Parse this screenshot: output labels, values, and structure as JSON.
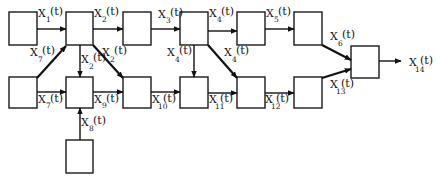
{
  "diagram": {
    "type": "block-flow-network",
    "nodes": [
      {
        "id": "B1",
        "x": 9,
        "y": 12,
        "w": 28,
        "h": 33
      },
      {
        "id": "B2",
        "x": 66,
        "y": 12,
        "w": 27,
        "h": 33
      },
      {
        "id": "B3",
        "x": 123,
        "y": 12,
        "w": 28,
        "h": 33
      },
      {
        "id": "B4",
        "x": 180,
        "y": 12,
        "w": 28,
        "h": 33
      },
      {
        "id": "B5",
        "x": 237,
        "y": 12,
        "w": 28,
        "h": 33
      },
      {
        "id": "B6",
        "x": 294,
        "y": 12,
        "w": 28,
        "h": 33
      },
      {
        "id": "B7",
        "x": 9,
        "y": 77,
        "w": 28,
        "h": 31
      },
      {
        "id": "B8",
        "x": 66,
        "y": 77,
        "w": 27,
        "h": 31
      },
      {
        "id": "B9",
        "x": 123,
        "y": 77,
        "w": 28,
        "h": 31
      },
      {
        "id": "B10",
        "x": 180,
        "y": 77,
        "w": 28,
        "h": 31
      },
      {
        "id": "B11",
        "x": 237,
        "y": 77,
        "w": 28,
        "h": 31
      },
      {
        "id": "B12",
        "x": 294,
        "y": 77,
        "w": 28,
        "h": 31
      },
      {
        "id": "B13",
        "x": 66,
        "y": 140,
        "w": 27,
        "h": 33
      },
      {
        "id": "B14",
        "x": 351,
        "y": 46,
        "w": 28,
        "h": 32
      }
    ],
    "edges": [
      {
        "from": "B1",
        "to": "B2",
        "label": "X",
        "sub": "1",
        "suffix": "(t)"
      },
      {
        "from": "B2",
        "to": "B3",
        "label": "X",
        "sub": "2",
        "suffix": "(t)"
      },
      {
        "from": "B2",
        "to": "B8",
        "label": "X",
        "sub": "2",
        "suffix": "(t)"
      },
      {
        "from": "B2",
        "to": "B9",
        "label": "X",
        "sub": "2",
        "suffix": "(t)"
      },
      {
        "from": "B3",
        "to": "B4",
        "label": "X",
        "sub": "3",
        "suffix": "(t)"
      },
      {
        "from": "B4",
        "to": "B5",
        "label": "X",
        "sub": "4",
        "suffix": "(t)"
      },
      {
        "from": "B4",
        "to": "B10",
        "label": "X",
        "sub": "4",
        "suffix": "(t)"
      },
      {
        "from": "B4",
        "to": "B11",
        "label": "X",
        "sub": "4",
        "suffix": "(t)"
      },
      {
        "from": "B5",
        "to": "B6",
        "label": "X",
        "sub": "5",
        "suffix": "(t)"
      },
      {
        "from": "B6",
        "to": "B14",
        "label": "X",
        "sub": "6",
        "suffix": "(t)"
      },
      {
        "from": "B7",
        "to": "B2",
        "label": "X",
        "sub": "7",
        "suffix": "(t)"
      },
      {
        "from": "B7",
        "to": "B8",
        "label": "X",
        "sub": "7",
        "suffix": "(t)"
      },
      {
        "from": "B13",
        "to": "B8",
        "label": "X",
        "sub": "8",
        "suffix": "(t)"
      },
      {
        "from": "B8",
        "to": "B9",
        "label": "X",
        "sub": "9",
        "suffix": "(t)"
      },
      {
        "from": "B9",
        "to": "B10",
        "label": "X",
        "sub": "10",
        "suffix": "(t)"
      },
      {
        "from": "B10",
        "to": "B11",
        "label": "X",
        "sub": "11",
        "suffix": "(t)"
      },
      {
        "from": "B11",
        "to": "B12",
        "label": "X",
        "sub": "12",
        "suffix": "(t)"
      },
      {
        "from": "B12",
        "to": "B14",
        "label": "X",
        "sub": "13",
        "suffix": "(t)"
      },
      {
        "from": "B14",
        "to": "output",
        "label": "X",
        "sub": "14",
        "suffix": "(t)"
      }
    ],
    "labels": {
      "x1": {
        "main": "X",
        "sub": "1",
        "arg": "(t)"
      },
      "x2_top": {
        "main": "X",
        "sub": "2",
        "arg": "(t)"
      },
      "x2_down": {
        "main": "X",
        "sub": "2",
        "arg": "(t)"
      },
      "x2_diag": {
        "main": "X",
        "sub": "2",
        "arg": "(t)"
      },
      "x3": {
        "main": "X",
        "sub": "3",
        "arg": "(t)"
      },
      "x4_top": {
        "main": "X",
        "sub": "4",
        "arg": "(t)"
      },
      "x4_down": {
        "main": "X",
        "sub": "4",
        "arg": "(t)"
      },
      "x4_diag": {
        "main": "X",
        "sub": "4",
        "arg": "(t)"
      },
      "x5": {
        "main": "X",
        "sub": "5",
        "arg": "(t)"
      },
      "x6": {
        "main": "X",
        "sub": "6",
        "arg": "(t)"
      },
      "x7_diag": {
        "main": "X",
        "sub": "7",
        "arg": "(t)"
      },
      "x7_bottom": {
        "main": "X",
        "sub": "7",
        "arg": "(t)"
      },
      "x8": {
        "main": "X",
        "sub": "8",
        "arg": "(t)"
      },
      "x9": {
        "main": "X",
        "sub": "9",
        "arg": "(t)"
      },
      "x10": {
        "main": "X",
        "sub": "10",
        "arg": "(t)"
      },
      "x11": {
        "main": "X",
        "sub": "11",
        "arg": "(t)"
      },
      "x12": {
        "main": "X",
        "sub": "12",
        "arg": "(t)"
      },
      "x13": {
        "main": "X",
        "sub": "13",
        "arg": "(t)"
      },
      "x14": {
        "main": "X",
        "sub": "14",
        "arg": "(t)"
      }
    }
  }
}
